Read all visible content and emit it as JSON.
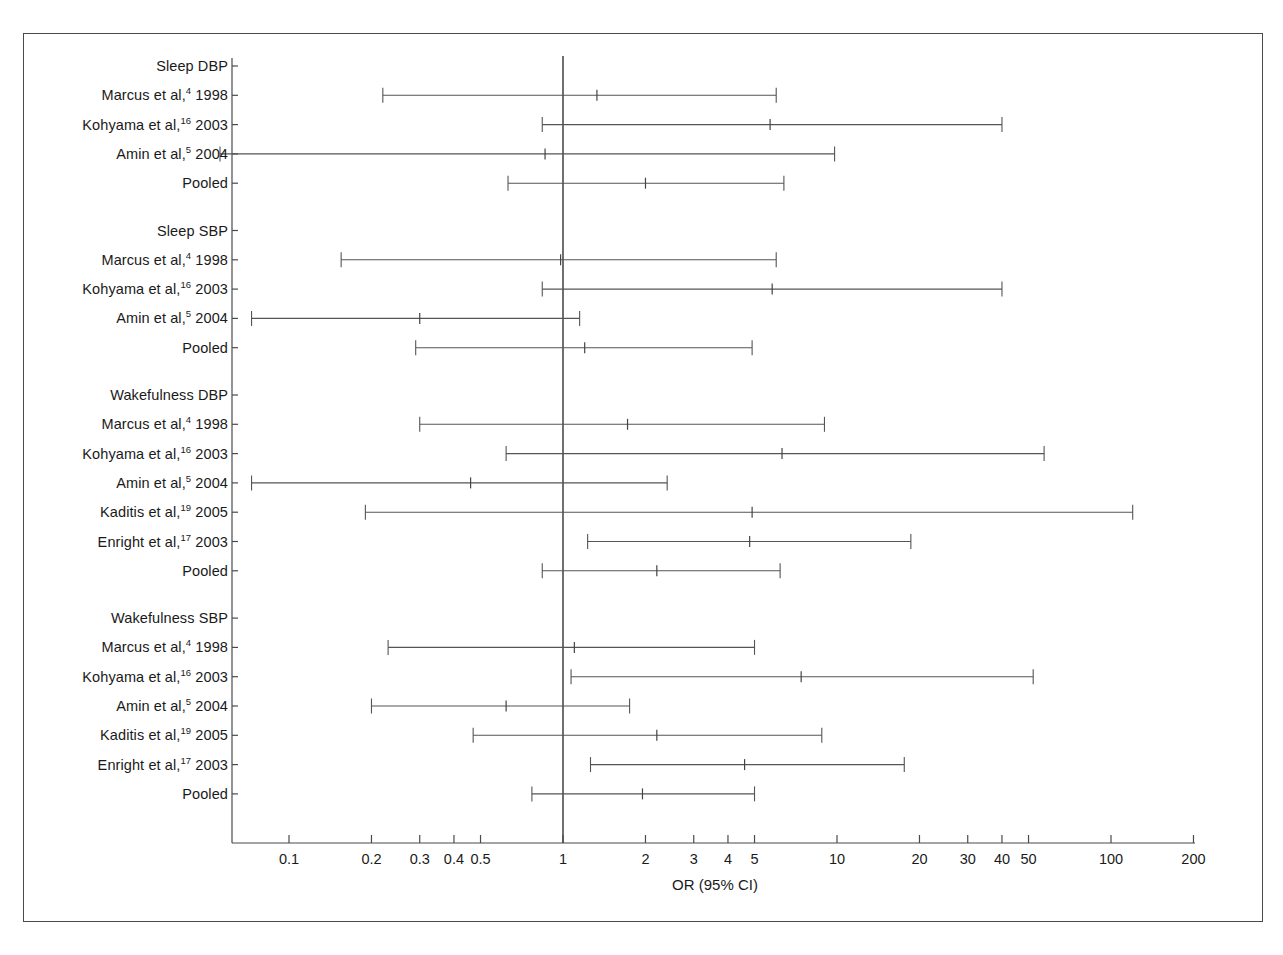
{
  "figure": {
    "axis_title": "OR (95% CI)",
    "axis_type": "log10",
    "x_tick_labels": [
      "0.1",
      "0.2",
      "0.3",
      "0.4",
      "0.5",
      "1",
      "2",
      "3",
      "4",
      "5",
      "10",
      "20",
      "30",
      "40",
      "50",
      "100",
      "200"
    ],
    "x_ticks": [
      0.1,
      0.2,
      0.3,
      0.4,
      0.5,
      1,
      2,
      3,
      4,
      5,
      10,
      20,
      30,
      40,
      50,
      100,
      200
    ],
    "reference_line": 1,
    "line_color": "#555555",
    "frame_color": "#4a4a4a",
    "background": "#ffffff"
  },
  "chart_data": {
    "type": "forest",
    "title": "",
    "xlabel": "OR (95% CI)",
    "ylabel": "",
    "xscale": "log",
    "xlim": [
      0.045,
      210
    ],
    "xticks": [
      0.1,
      0.2,
      0.3,
      0.4,
      0.5,
      1,
      2,
      3,
      4,
      5,
      10,
      20,
      30,
      40,
      50,
      100,
      200
    ],
    "xticklabels": [
      "0.1",
      "0.2",
      "0.3",
      "0.4",
      "0.5",
      "1",
      "2",
      "3",
      "4",
      "5",
      "10",
      "20",
      "30",
      "40",
      "50",
      "100",
      "200"
    ],
    "reference_line": 1,
    "grid": false,
    "legend": "none",
    "groups": [
      {
        "name": "Sleep DBP",
        "rows": [
          {
            "label": "Marcus et al,",
            "ref": "4",
            "year": " 1998",
            "or": 1.33,
            "lo": 0.22,
            "hi": 6.0
          },
          {
            "label": "Kohyama et al,",
            "ref": "16",
            "year": " 2003",
            "or": 5.7,
            "lo": 0.84,
            "hi": 40.0
          },
          {
            "label": "Amin et al,",
            "ref": "5",
            "year": " 2004",
            "or": 0.86,
            "lo": 0.056,
            "hi": 9.8
          },
          {
            "label": "Pooled",
            "ref": "",
            "year": "",
            "or": 2.0,
            "lo": 0.63,
            "hi": 6.4
          }
        ]
      },
      {
        "name": "Sleep SBP",
        "rows": [
          {
            "label": "Marcus et al,",
            "ref": "4",
            "year": " 1998",
            "or": 0.98,
            "lo": 0.155,
            "hi": 6.0
          },
          {
            "label": "Kohyama et al,",
            "ref": "16",
            "year": " 2003",
            "or": 5.8,
            "lo": 0.84,
            "hi": 40.0
          },
          {
            "label": "Amin et al,",
            "ref": "5",
            "year": " 2004",
            "or": 0.3,
            "lo": 0.073,
            "hi": 1.15
          },
          {
            "label": "Pooled",
            "ref": "",
            "year": "",
            "or": 1.2,
            "lo": 0.29,
            "hi": 4.9
          }
        ]
      },
      {
        "name": "Wakefulness DBP",
        "rows": [
          {
            "label": "Marcus et al,",
            "ref": "4",
            "year": " 1998",
            "or": 1.72,
            "lo": 0.3,
            "hi": 9.0
          },
          {
            "label": "Kohyama et al,",
            "ref": "16",
            "year": " 2003",
            "or": 6.3,
            "lo": 0.62,
            "hi": 57.0
          },
          {
            "label": "Amin et al,",
            "ref": "5",
            "year": " 2004",
            "or": 0.46,
            "lo": 0.073,
            "hi": 2.4
          },
          {
            "label": "Kaditis et al,",
            "ref": "19",
            "year": " 2005",
            "or": 4.9,
            "lo": 0.19,
            "hi": 120.0
          },
          {
            "label": "Enright et al,",
            "ref": "17",
            "year": " 2003",
            "or": 4.8,
            "lo": 1.23,
            "hi": 18.6
          },
          {
            "label": "Pooled",
            "ref": "",
            "year": "",
            "or": 2.2,
            "lo": 0.84,
            "hi": 6.2
          }
        ]
      },
      {
        "name": "Wakefulness SBP",
        "rows": [
          {
            "label": "Marcus et al,",
            "ref": "4",
            "year": " 1998",
            "or": 1.1,
            "lo": 0.23,
            "hi": 5.0
          },
          {
            "label": "Kohyama et al,",
            "ref": "16",
            "year": " 2003",
            "or": 7.4,
            "lo": 1.07,
            "hi": 52.0
          },
          {
            "label": "Amin et al,",
            "ref": "5",
            "year": " 2004",
            "or": 0.62,
            "lo": 0.2,
            "hi": 1.75
          },
          {
            "label": "Kaditis et al,",
            "ref": "19",
            "year": " 2005",
            "or": 2.2,
            "lo": 0.47,
            "hi": 8.8
          },
          {
            "label": "Enright et al,",
            "ref": "17",
            "year": " 2003",
            "or": 4.6,
            "lo": 1.26,
            "hi": 17.6
          },
          {
            "label": "Pooled",
            "ref": "",
            "year": "",
            "or": 1.95,
            "lo": 0.77,
            "hi": 5.0
          }
        ]
      }
    ]
  }
}
